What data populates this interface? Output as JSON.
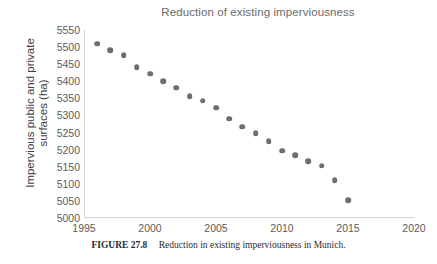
{
  "chart_data": {
    "type": "scatter",
    "title": "Reduction of existing imperviousness",
    "xlabel": "",
    "ylabel": "Impervious public and private\nsurfaces (ha)",
    "xlim": [
      1995,
      2020
    ],
    "ylim": [
      5000,
      5550
    ],
    "xticks": [
      1995,
      2000,
      2005,
      2010,
      2015,
      2020
    ],
    "yticks": [
      5000,
      5050,
      5100,
      5150,
      5200,
      5250,
      5300,
      5350,
      5400,
      5450,
      5500,
      5550
    ],
    "grid": false,
    "legend": null,
    "marker_color": "#6e6e72",
    "series": [
      {
        "name": "Impervious public and private surfaces",
        "x": [
          1996,
          1997,
          1998,
          1999,
          2000,
          2001,
          2002,
          2003,
          2004,
          2005,
          2006,
          2007,
          2008,
          2009,
          2010,
          2011,
          2012,
          2013,
          2014,
          2015
        ],
        "values": [
          5510,
          5491,
          5477,
          5441,
          5422,
          5400,
          5381,
          5357,
          5343,
          5323,
          5291,
          5267,
          5248,
          5225,
          5197,
          5183,
          5167,
          5153,
          5110,
          5052
        ]
      }
    ]
  },
  "caption": {
    "label": "FIGURE 27.8",
    "text": "Reduction in existing imperviousness in Munich."
  }
}
